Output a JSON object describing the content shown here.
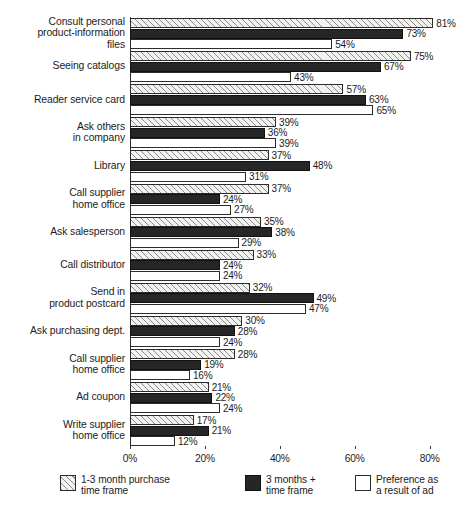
{
  "chart_data": {
    "type": "bar",
    "orientation": "horizontal",
    "title": "",
    "xlabel": "",
    "ylabel": "",
    "xlim": [
      0,
      85
    ],
    "grid": false,
    "legend_position": "bottom",
    "value_suffix": "%",
    "xticks": [
      "0%",
      "20%",
      "40%",
      "60%",
      "80%"
    ],
    "xtick_values": [
      0,
      20,
      40,
      60,
      80
    ],
    "categories": [
      "Consult personal product-information files",
      "Seeing catalogs",
      "Reader service card",
      "Ask others in company",
      "Library",
      "Call supplier home office",
      "Ask salesperson",
      "Call distributor",
      "Send in product postcard",
      "Ask purchasing dept.",
      "Call supplier home office",
      "Ad coupon",
      "Write supplier home office"
    ],
    "category_lines": [
      [
        "Consult personal",
        "product-information",
        "files"
      ],
      [
        "Seeing catalogs"
      ],
      [
        "Reader service card"
      ],
      [
        "Ask others",
        "in company"
      ],
      [
        "Library"
      ],
      [
        "Call supplier",
        "home office"
      ],
      [
        "Ask salesperson"
      ],
      [
        "Call distributor"
      ],
      [
        "Send in",
        "product postcard"
      ],
      [
        "Ask purchasing dept."
      ],
      [
        "Call supplier",
        "home office"
      ],
      [
        "Ad coupon"
      ],
      [
        "Write supplier",
        "home office"
      ]
    ],
    "series": [
      {
        "name": "1-3 month purchase time frame",
        "legend_lines": [
          "1-3 month purchase",
          "time frame"
        ],
        "style": "hatched",
        "values": [
          81,
          75,
          57,
          39,
          37,
          37,
          35,
          33,
          32,
          30,
          28,
          21,
          17
        ],
        "labels": [
          "81%",
          "75%",
          "57%",
          "39%",
          "37%",
          "37%",
          "35%",
          "33%",
          "32%",
          "30%",
          "28%",
          "21%",
          "17%"
        ]
      },
      {
        "name": "3 months + time frame",
        "legend_lines": [
          "3 months +",
          "time frame"
        ],
        "style": "black",
        "values": [
          73,
          67,
          63,
          36,
          48,
          24,
          38,
          24,
          49,
          28,
          19,
          22,
          21
        ],
        "labels": [
          "73%",
          "67%",
          "63%",
          "36%",
          "48%",
          "24%",
          "38%",
          "24%",
          "49%",
          "28%",
          "19%",
          "22%",
          "21%"
        ]
      },
      {
        "name": "Preference as a result of ad",
        "legend_lines": [
          "Preference as",
          "a result of ad"
        ],
        "style": "white",
        "values": [
          54,
          43,
          65,
          39,
          31,
          27,
          29,
          24,
          47,
          24,
          16,
          24,
          12
        ],
        "labels": [
          "54%",
          "43%",
          "65%",
          "39%",
          "31%",
          "27%",
          "29%",
          "24%",
          "47%",
          "24%",
          "16%",
          "24%",
          "12%"
        ]
      }
    ]
  },
  "colors": {
    "hatched_fill": "#f2f2f0",
    "hatch_line": "#8c8c8c",
    "black_fill": "#262626",
    "white_fill": "#ffffff",
    "outline": "#2b2b2b",
    "text": "#1c1c1c",
    "background": "#ffffff"
  }
}
